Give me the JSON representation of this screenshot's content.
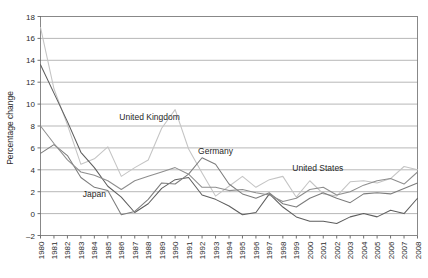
{
  "chart_data": {
    "type": "line",
    "title": "",
    "xlabel": "",
    "ylabel": "Percentage change",
    "ylim": [
      -2,
      18
    ],
    "ytick_step": 2,
    "grid": true,
    "legend": "inline-labels",
    "yticks": [
      -2,
      0,
      2,
      4,
      6,
      8,
      10,
      12,
      14,
      16,
      18
    ],
    "categories": [
      "1980",
      "1981",
      "1982",
      "1983",
      "1984",
      "1985",
      "1986",
      "1987",
      "1988",
      "1989",
      "1990",
      "1991",
      "1992",
      "1993",
      "1994",
      "1995",
      "1996",
      "1997",
      "1998",
      "1999",
      "2000",
      "2001",
      "2002",
      "2003",
      "2004",
      "2005",
      "2006",
      "2007",
      "2008"
    ],
    "series": [
      {
        "name": "United Kingdom",
        "color": "#c4c4c4",
        "label_x": 1988.1,
        "label_y": 8.55,
        "values": [
          17.0,
          11.4,
          8.1,
          4.5,
          5.0,
          6.1,
          3.4,
          4.2,
          4.9,
          7.8,
          9.5,
          5.9,
          3.7,
          1.6,
          2.5,
          3.4,
          2.4,
          3.1,
          3.4,
          1.5,
          3.0,
          1.8,
          1.6,
          2.9,
          3.0,
          2.8,
          3.2,
          4.3,
          4.0
        ]
      },
      {
        "name": "Japan",
        "color": "#5e5e5e",
        "label_x": 1984.0,
        "label_y": 1.55,
        "values": [
          13.6,
          11.0,
          8.4,
          5.6,
          4.2,
          2.5,
          1.5,
          0.1,
          0.9,
          2.3,
          3.1,
          3.3,
          1.7,
          1.3,
          0.7,
          -0.1,
          0.1,
          1.8,
          0.6,
          -0.3,
          -0.7,
          -0.7,
          -0.9,
          -0.3,
          0.0,
          -0.3,
          0.3,
          0.0,
          1.4
        ]
      },
      {
        "name": "Germany",
        "color": "#7c7c7c",
        "label_x": 1993.0,
        "label_y": 5.45,
        "values": [
          5.5,
          6.3,
          5.3,
          3.3,
          2.4,
          2.1,
          -0.1,
          0.2,
          1.3,
          2.8,
          2.7,
          3.6,
          5.1,
          4.5,
          2.7,
          1.8,
          1.4,
          1.9,
          0.9,
          0.6,
          1.4,
          1.9,
          1.4,
          1.0,
          1.8,
          1.9,
          1.8,
          2.3,
          2.8
        ]
      },
      {
        "name": "United States",
        "color": "#8e8e8e",
        "label_x": 2000.6,
        "label_y": 3.85,
        "values": [
          8.0,
          6.4,
          4.9,
          3.8,
          3.5,
          3.0,
          2.2,
          3.0,
          3.4,
          3.8,
          4.2,
          3.6,
          2.4,
          2.4,
          2.1,
          2.2,
          1.9,
          1.7,
          1.1,
          1.4,
          2.2,
          2.4,
          1.7,
          2.0,
          2.6,
          3.0,
          3.2,
          2.7,
          3.8
        ]
      }
    ]
  },
  "axis": {
    "ylabel": "Percentage change"
  }
}
